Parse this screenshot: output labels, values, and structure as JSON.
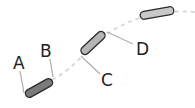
{
  "diagram": {
    "labels": {
      "a": "A",
      "b": "B",
      "c": "C",
      "d": "D"
    },
    "colors": {
      "segment_dark": "#7a7a7a",
      "segment_mid": "#b5b5b5",
      "segment_light": "#c8c8c8",
      "outline": "#2a2a2a",
      "leader": "#b0b0b0",
      "path": "#d9d9d9"
    }
  }
}
